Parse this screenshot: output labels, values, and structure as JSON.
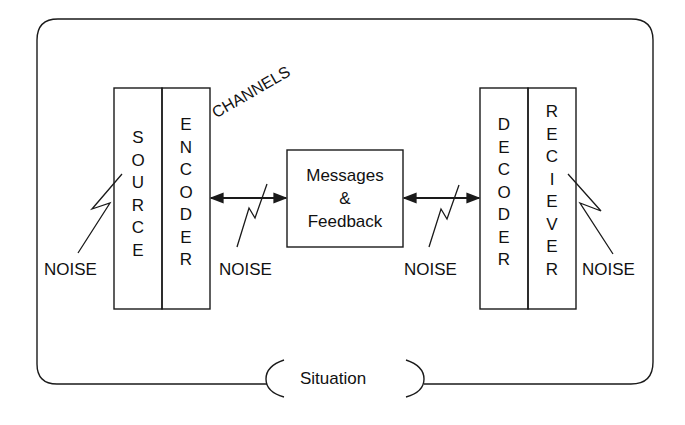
{
  "diagram": {
    "type": "communication-model",
    "situation_label": "Situation",
    "channels_label": "CHANNELS",
    "center_box": {
      "line1": "Messages",
      "line2": "&",
      "line3": "Feedback"
    },
    "blocks": {
      "source": {
        "label": "SOURCE",
        "letters": [
          "S",
          "O",
          "U",
          "R",
          "C",
          "E"
        ]
      },
      "encoder": {
        "label": "ENCODER",
        "letters": [
          "E",
          "N",
          "C",
          "O",
          "D",
          "E",
          "R"
        ]
      },
      "decoder": {
        "label": "DECODER",
        "letters": [
          "D",
          "E",
          "C",
          "O",
          "D",
          "E",
          "R"
        ]
      },
      "receiver": {
        "label": "RECIEVER",
        "letters": [
          "R",
          "E",
          "C",
          "I",
          "E",
          "V",
          "E",
          "R"
        ]
      }
    },
    "noise_labels": {
      "source": "NOISE",
      "channel_left": "NOISE",
      "channel_right": "NOISE",
      "receiver": "NOISE"
    },
    "line_color": "#1a1a1a",
    "background": "#ffffff"
  }
}
